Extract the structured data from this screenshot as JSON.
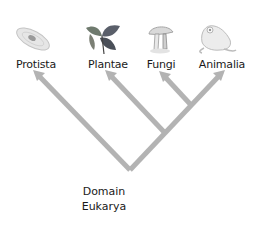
{
  "diagram": {
    "type": "cladogram",
    "root": {
      "label_line1": "Domain",
      "label_line2": "Eukarya"
    },
    "taxa": [
      {
        "name": "Protista",
        "icon": "protist-icon"
      },
      {
        "name": "Plantae",
        "icon": "plant-icon"
      },
      {
        "name": "Fungi",
        "icon": "mushroom-icon"
      },
      {
        "name": "Animalia",
        "icon": "frog-icon"
      }
    ],
    "branch_color": "#b3b3b3",
    "text_color": "#1a1a1a"
  }
}
